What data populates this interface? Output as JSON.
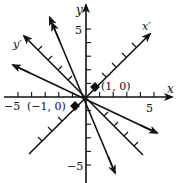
{
  "diagram": {
    "type": "coordinate-plane-rotated-axes",
    "axes": {
      "x_label": "x",
      "y_label": "y",
      "x_tick_labels": [
        "−5",
        "5"
      ],
      "y_tick_labels": [
        "5",
        "−5"
      ],
      "x_range": [
        -5,
        5
      ],
      "y_range": [
        -5,
        5
      ]
    },
    "rotated_axes": {
      "x_prime_label": "x′",
      "y_prime_label": "y′"
    },
    "points": [
      {
        "label": "(1, 0)",
        "x": 1,
        "y": 0
      },
      {
        "label": "(−1, 0)",
        "x": -1,
        "y": 0
      }
    ],
    "curves_description": "Two branch lines through the foci (±1, 0) crossing diagonally, with rotated x′ and y′ axes"
  }
}
